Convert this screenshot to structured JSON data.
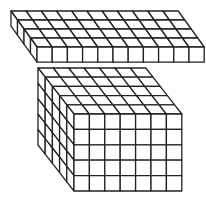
{
  "diagram": {
    "stroke_color": "#222222",
    "fill_color": "#ffffff",
    "top_slab": {
      "label": "slab",
      "columns": 11,
      "depth": 4,
      "layers": 1,
      "origin_x": 37,
      "origin_y": 47,
      "cell": 15.2,
      "dx": 6.5,
      "dy": -9
    },
    "bottom_block": {
      "label": "block",
      "columns": 7,
      "depth": 5,
      "layers": 5,
      "origin_x": 74,
      "origin_y": 114,
      "cell": 15.4,
      "dx": -7.2,
      "dy": -9.2
    }
  }
}
